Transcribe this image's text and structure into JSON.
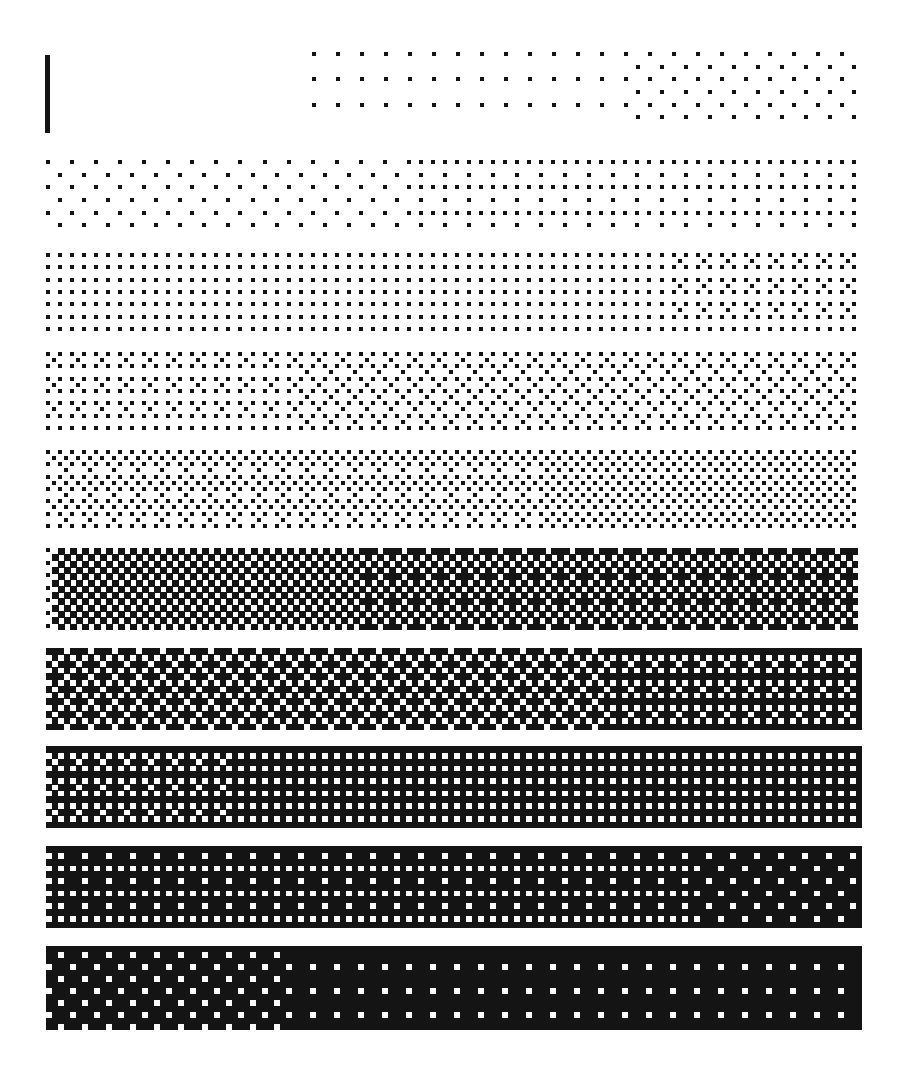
{
  "figure": {
    "background": "#ffffff",
    "ink": "#141414",
    "marker": {
      "x": 45,
      "y": 55,
      "w": 5,
      "h": 78
    },
    "bands": [
      {
        "id": 1,
        "x": 312,
        "y": 52,
        "w": 546,
        "h": 76,
        "level_start": 0.06,
        "level_end": 0.12
      },
      {
        "id": 2,
        "x": 46,
        "y": 160,
        "w": 812,
        "h": 76,
        "level_start": 0.12,
        "level_end": 0.2
      },
      {
        "id": 3,
        "x": 46,
        "y": 253,
        "w": 812,
        "h": 80,
        "level_start": 0.22,
        "level_end": 0.3
      },
      {
        "id": 4,
        "x": 46,
        "y": 352,
        "w": 812,
        "h": 80,
        "level_start": 0.32,
        "level_end": 0.4
      },
      {
        "id": 5,
        "x": 46,
        "y": 450,
        "w": 812,
        "h": 80,
        "level_start": 0.42,
        "level_end": 0.5
      },
      {
        "id": 6,
        "x": 46,
        "y": 548,
        "w": 812,
        "h": 82,
        "level_start": 0.5,
        "level_end": 0.58
      },
      {
        "id": 7,
        "x": 46,
        "y": 648,
        "w": 816,
        "h": 82,
        "level_start": 0.6,
        "level_end": 0.68
      },
      {
        "id": 8,
        "x": 46,
        "y": 746,
        "w": 816,
        "h": 82,
        "level_start": 0.7,
        "level_end": 0.78
      },
      {
        "id": 9,
        "x": 46,
        "y": 846,
        "w": 816,
        "h": 82,
        "level_start": 0.78,
        "level_end": 0.86
      },
      {
        "id": 10,
        "x": 46,
        "y": 946,
        "w": 816,
        "h": 84,
        "level_start": 0.88,
        "level_end": 0.97
      }
    ],
    "cell_size": 9
  }
}
